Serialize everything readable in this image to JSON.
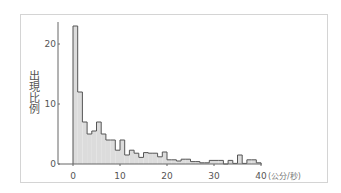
{
  "chart_data": {
    "type": "bar",
    "subtype": "histogram",
    "title": "",
    "xlabel": "(公分/秒)",
    "ylabel": "出現比例",
    "xlim": [
      0,
      40
    ],
    "ylim": [
      0,
      24
    ],
    "x_ticks": [
      0,
      10,
      20,
      30,
      40
    ],
    "y_ticks": [
      0,
      10,
      20
    ],
    "bin_width": 1,
    "bin_edges_start": 0,
    "values": [
      23,
      12,
      7,
      5,
      5.5,
      7,
      5,
      4,
      4,
      2.3,
      4,
      1.5,
      2.3,
      1.8,
      1.1,
      1.9,
      1.8,
      1.8,
      1.2,
      2,
      0.7,
      0.7,
      0.5,
      0.8,
      0.8,
      0.4,
      0.4,
      0.2,
      0.2,
      0.6,
      0.6,
      0.6,
      0,
      0.6,
      0.1,
      1.5,
      0.1,
      0.7,
      0.7,
      0.2
    ],
    "grid": false,
    "legend": null
  },
  "labels": {
    "ylabel": "出現比例",
    "xunit": "(公分/秒)",
    "xticks": [
      "0",
      "10",
      "20",
      "30",
      "40"
    ],
    "yticks": [
      "0",
      "10",
      "20"
    ]
  },
  "colors": {
    "fill": "#dcdcdc",
    "outline": "#555555",
    "axis": "#666666",
    "frame": "#d4d4d4"
  }
}
